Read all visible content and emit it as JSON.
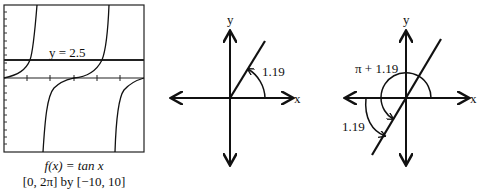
{
  "panel_graph": {
    "function_label": "f(x) = tan x",
    "window_label": "[0, 2π] by [−10, 10]",
    "line_label": "y = 2.5",
    "xmin": "0",
    "xmax": "2π",
    "ymin": "-10",
    "ymax": "10",
    "horizontal_line_y": 2.5
  },
  "panel_angle1": {
    "x_axis_label": "x",
    "y_axis_label": "y",
    "angle_label": "1.19"
  },
  "panel_angle2": {
    "x_axis_label": "x",
    "y_axis_label": "y",
    "angle_label_large": "π + 1.19",
    "angle_label_small": "1.19"
  }
}
